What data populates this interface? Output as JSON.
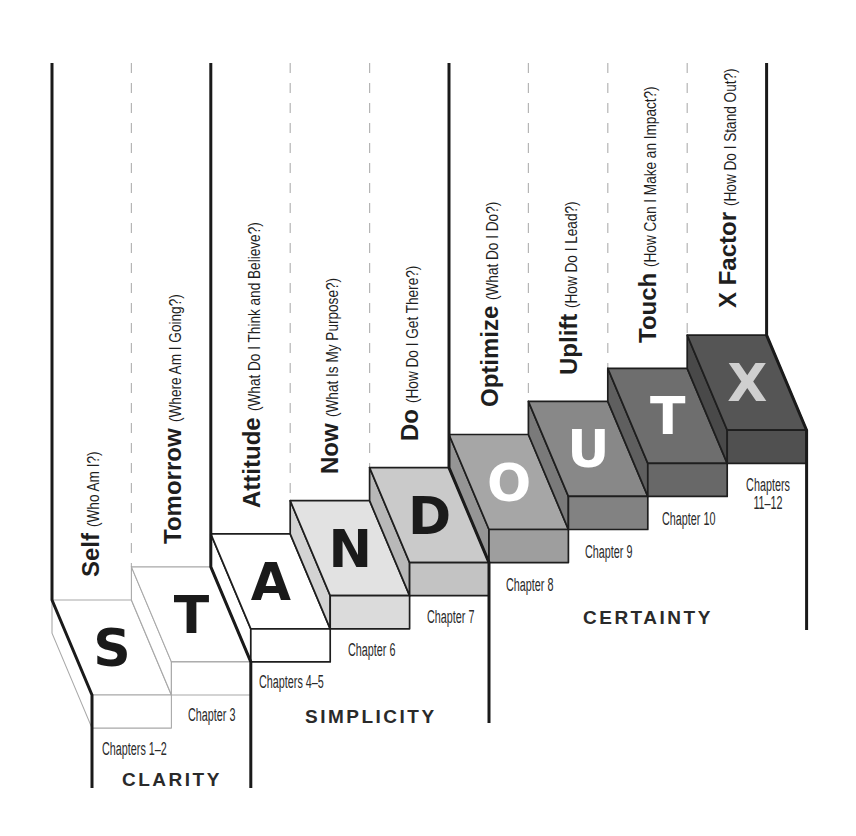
{
  "diagram": {
    "columns": [
      {
        "word": "Self",
        "question": "(Who Am I?)"
      },
      {
        "word": "Tomorrow",
        "question": "(Where Am I Going?)"
      },
      {
        "word": "Attitude",
        "question": "(What Do I Think and Believe?)"
      },
      {
        "word": "Now",
        "question": "(What Is My Purpose?)"
      },
      {
        "word": "Do",
        "question": "(How Do I Get There?)"
      },
      {
        "word": "Optimize",
        "question": "(What Do I Do?)"
      },
      {
        "word": "Uplift",
        "question": "(How Do I Lead?)"
      },
      {
        "word": "Touch",
        "question": "(How Can I Make an Impact?)"
      },
      {
        "word": "X Factor",
        "question": "(How Do I Stand Out?)"
      }
    ],
    "steps": [
      {
        "letter": "S",
        "chapter_lines": [
          "Chapters 1–2"
        ],
        "top_color": "#ffffff",
        "side_color": "#ffffff",
        "front_color": "#ffffff",
        "letter_color": "#1a1a1a",
        "edge_color": "#a8a8a8"
      },
      {
        "letter": "T",
        "chapter_lines": [
          "Chapter 3"
        ],
        "top_color": "#ffffff",
        "side_color": "#ffffff",
        "front_color": "#ffffff",
        "letter_color": "#1a1a1a",
        "edge_color": "#a8a8a8"
      },
      {
        "letter": "A",
        "chapter_lines": [
          "Chapters 4–5"
        ],
        "top_color": "#ffffff",
        "side_color": "#ffffff",
        "front_color": "#ffffff",
        "letter_color": "#1a1a1a",
        "edge_color": "#1e1e1e"
      },
      {
        "letter": "N",
        "chapter_lines": [
          "Chapter 6"
        ],
        "top_color": "#e2e2e2",
        "side_color": "#d3d3d3",
        "front_color": "#dbdbdb",
        "letter_color": "#1a1a1a",
        "edge_color": "#1e1e1e"
      },
      {
        "letter": "D",
        "chapter_lines": [
          "Chapter 7"
        ],
        "top_color": "#cacaca",
        "side_color": "#b8b8b8",
        "front_color": "#c3c3c3",
        "letter_color": "#1a1a1a",
        "edge_color": "#1e1e1e"
      },
      {
        "letter": "O",
        "chapter_lines": [
          "Chapter 8"
        ],
        "top_color": "#a6a6a6",
        "side_color": "#959595",
        "front_color": "#9e9e9e",
        "letter_color": "#ffffff",
        "edge_color": "#1e1e1e"
      },
      {
        "letter": "U",
        "chapter_lines": [
          "Chapter 9"
        ],
        "top_color": "#888888",
        "side_color": "#7a7a7a",
        "front_color": "#828282",
        "letter_color": "#ffffff",
        "edge_color": "#1e1e1e"
      },
      {
        "letter": "T",
        "chapter_lines": [
          "Chapter 10"
        ],
        "top_color": "#6e6e6e",
        "side_color": "#5f5f5f",
        "front_color": "#686868",
        "letter_color": "#ffffff",
        "edge_color": "#1e1e1e"
      },
      {
        "letter": "X",
        "chapter_lines": [
          "Chapters",
          "11–12"
        ],
        "top_color": "#555555",
        "side_color": "#494949",
        "front_color": "#505050",
        "letter_color": "#cfcfcf",
        "edge_color": "#1e1e1e"
      }
    ],
    "groups": [
      {
        "label": "CLARITY"
      },
      {
        "label": "SIMPLICITY"
      },
      {
        "label": "CERTAINTY"
      }
    ],
    "colors": {
      "divider": "#1a1a1a",
      "guide": "#b5b5b5"
    }
  }
}
